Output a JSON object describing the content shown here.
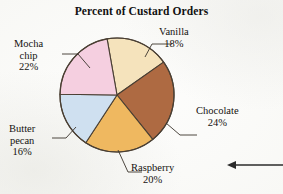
{
  "chart_data": {
    "type": "pie",
    "title": "Percent of Custard Orders",
    "xlabel": "",
    "ylabel": "",
    "legend_position": "none (direct labels with leader lines)",
    "grid": false,
    "unit": "%",
    "categories": [
      "Vanilla",
      "Chocolate",
      "Raspberry",
      "Butter pecan",
      "Mocha chip"
    ],
    "values": [
      18,
      24,
      20,
      16,
      22
    ],
    "slices": [
      {
        "label": "Vanilla",
        "value": 18,
        "value_text": "18%",
        "color": "#f5e3bc",
        "start_angle": -10,
        "sweep": 64.8
      },
      {
        "label": "Chocolate",
        "value": 24,
        "value_text": "24%",
        "color": "#ae6a42",
        "start_angle": 54.8,
        "sweep": 86.4
      },
      {
        "label": "Raspberry",
        "value": 20,
        "value_text": "20%",
        "color": "#efb860",
        "start_angle": 141.2,
        "sweep": 72
      },
      {
        "label": "Butter pecan",
        "value": 16,
        "value_text": "16%",
        "color": "#cfe0f0",
        "start_angle": 213.2,
        "sweep": 57.6
      },
      {
        "label": "Mocha chip",
        "value": 22,
        "value_text": "22%",
        "color": "#f5cfe0",
        "start_angle": 270.8,
        "sweep": 79.2
      }
    ],
    "total": 100
  },
  "title": "Percent of Custard Orders",
  "labels": {
    "vanilla": {
      "name": "Vanilla",
      "percent": "18%"
    },
    "chocolate": {
      "name": "Chocolate",
      "percent": "24%"
    },
    "raspberry": {
      "name": "Raspberry",
      "percent": "20%"
    },
    "butter": {
      "name_line1": "Butter",
      "name_line2": "pecan",
      "percent": "16%"
    },
    "mocha": {
      "name_line1": "Mocha",
      "name_line2": "chip",
      "percent": "22%"
    }
  },
  "colors": {
    "vanilla": "#f5e3bc",
    "chocolate": "#ae6a42",
    "raspberry": "#efb860",
    "butter_pecan": "#cfe0f0",
    "mocha_chip": "#f5cfe0",
    "outline": "#4a3f33",
    "background": "#fbfbf9",
    "text": "#15120f"
  },
  "margin_marker": {
    "icon": "arrow-left-icon"
  }
}
